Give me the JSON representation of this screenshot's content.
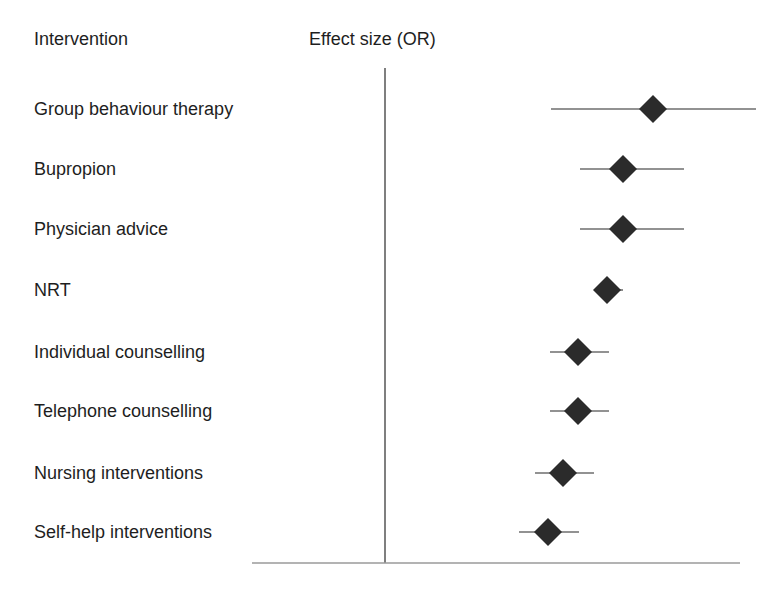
{
  "headers": {
    "intervention": "Intervention",
    "effect": "Effect size (OR)"
  },
  "colors": {
    "text": "#1e1e1e",
    "marker": "#2b2b2b",
    "ci_line": "#6e6e6e",
    "ref_line": "#555555",
    "axis_line": "#9a9a9a"
  },
  "chart_data": {
    "type": "forest",
    "title": "",
    "xlabel": "Effect size (OR)",
    "ylabel": "Intervention",
    "x_tick_labels": [],
    "grid": false,
    "legend": null,
    "reference_line": {
      "label": "OR = 1 (no effect)",
      "x_px": 385
    },
    "axis": {
      "x_start_px": 252,
      "x_end_px": 740,
      "y_px": 563
    },
    "categories": [
      "Group behaviour therapy",
      "Bupropion",
      "Physician advice",
      "NRT",
      "Individual counselling",
      "Telephone counselling",
      "Nursing interventions",
      "Self-help interventions"
    ],
    "series": [
      {
        "name": "Odds ratio (point estimate with CI, pixel positions — no numeric ticks shown)",
        "rows": [
          {
            "label": "Group behaviour therapy",
            "y_px": 109,
            "point_px": 653,
            "ci_low_px": 551,
            "ci_high_px": 756
          },
          {
            "label": "Bupropion",
            "y_px": 169,
            "point_px": 623,
            "ci_low_px": 580,
            "ci_high_px": 684
          },
          {
            "label": "Physician advice",
            "y_px": 229,
            "point_px": 623,
            "ci_low_px": 580,
            "ci_high_px": 684
          },
          {
            "label": "NRT",
            "y_px": 290,
            "point_px": 607,
            "ci_low_px": 594,
            "ci_high_px": 623
          },
          {
            "label": "Individual counselling",
            "y_px": 352,
            "point_px": 578,
            "ci_low_px": 550,
            "ci_high_px": 609
          },
          {
            "label": "Telephone counselling",
            "y_px": 411,
            "point_px": 578,
            "ci_low_px": 550,
            "ci_high_px": 609
          },
          {
            "label": "Nursing interventions",
            "y_px": 473,
            "point_px": 563,
            "ci_low_px": 535,
            "ci_high_px": 594
          },
          {
            "label": "Self-help interventions",
            "y_px": 532,
            "point_px": 548,
            "ci_low_px": 519,
            "ci_high_px": 579
          }
        ]
      }
    ],
    "ranking_high_to_low": [
      "Group behaviour therapy",
      "Bupropion",
      "Physician advice",
      "NRT",
      "Individual counselling",
      "Telephone counselling",
      "Nursing interventions",
      "Self-help interventions"
    ]
  }
}
